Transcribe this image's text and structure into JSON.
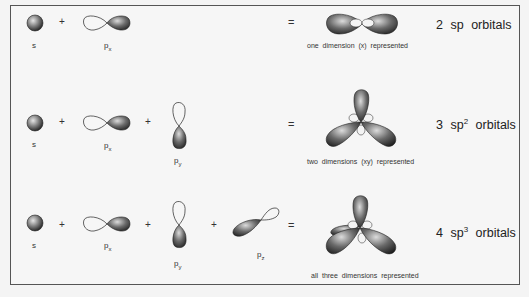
{
  "diagram": {
    "rows": [
      {
        "inputs": [
          {
            "orbital": "s",
            "label": "s"
          },
          {
            "orbital": "px",
            "label_main": "p",
            "label_sub": "x"
          }
        ],
        "operators": [
          "+",
          "="
        ],
        "caption": "one dimension (x) represented",
        "result_count": "2",
        "result_main": "sp",
        "result_sup": "",
        "result_suffix": "orbitals"
      },
      {
        "inputs": [
          {
            "orbital": "s",
            "label": "s"
          },
          {
            "orbital": "px",
            "label_main": "p",
            "label_sub": "x"
          },
          {
            "orbital": "py",
            "label_main": "p",
            "label_sub": "y"
          }
        ],
        "operators": [
          "+",
          "+",
          "="
        ],
        "caption": "two dimensions (xy) represented",
        "result_count": "3",
        "result_main": "sp",
        "result_sup": "2",
        "result_suffix": "orbitals"
      },
      {
        "inputs": [
          {
            "orbital": "s",
            "label": "s"
          },
          {
            "orbital": "px",
            "label_main": "p",
            "label_sub": "x"
          },
          {
            "orbital": "py",
            "label_main": "p",
            "label_sub": "y"
          },
          {
            "orbital": "pz",
            "label_main": "p",
            "label_sub": "z"
          }
        ],
        "operators": [
          "+",
          "+",
          "+",
          "="
        ],
        "caption": "all three dimensions represented",
        "result_count": "4",
        "result_main": "sp",
        "result_sup": "3",
        "result_suffix": "orbitals"
      }
    ],
    "colors": {
      "frame_border": "#555555",
      "background": "#f6f6f6",
      "lobe_dark": "#2a2a2a",
      "lobe_light": "#d8d8d8"
    }
  }
}
